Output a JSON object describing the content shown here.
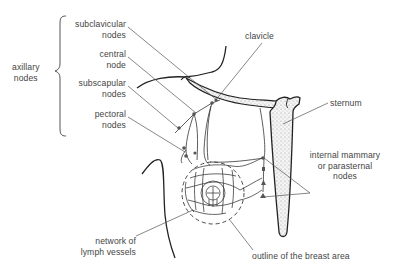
{
  "diagram": {
    "title": "",
    "labels": {
      "axillary_group": [
        "axillary",
        "nodes"
      ],
      "subclavicular": [
        "subclavicular",
        "nodes"
      ],
      "central": [
        "central",
        "node"
      ],
      "subscapular": [
        "subscapular",
        "nodes"
      ],
      "pectoral": [
        "pectoral",
        "nodes"
      ],
      "clavicle": "clavicle",
      "sternum": "sternum",
      "internal_mammary": [
        "internal mammary",
        "or parasternal",
        "nodes"
      ],
      "network": [
        "network of",
        "lymph vessels"
      ],
      "outline": "outline of the breast area"
    },
    "colors": {
      "line": "#2a2a2a",
      "leader": "#555555",
      "text": "#444444",
      "bone_fill": "#e6e6e6"
    }
  }
}
